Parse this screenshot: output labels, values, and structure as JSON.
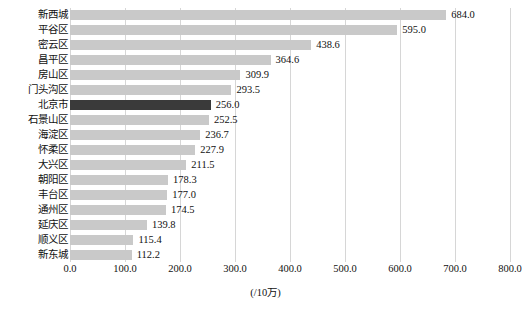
{
  "chart_data": {
    "type": "bar",
    "orientation": "horizontal",
    "title": "",
    "xlabel": "(/10万)",
    "ylabel": "",
    "xlim": [
      0,
      800
    ],
    "grid": true,
    "legend": null,
    "unit_label": "(/10万)",
    "categories": [
      "新西城",
      "平谷区",
      "密云区",
      "昌平区",
      "房山区",
      "门头沟区",
      "北京市",
      "石景山区",
      "海淀区",
      "怀柔区",
      "大兴区",
      "朝阳区",
      "丰台区",
      "通州区",
      "延庆区",
      "顺义区",
      "新东城"
    ],
    "values": [
      684.0,
      595.0,
      438.6,
      364.6,
      309.9,
      293.5,
      256.0,
      252.5,
      236.7,
      227.9,
      211.5,
      178.3,
      177.0,
      174.5,
      139.8,
      115.4,
      112.2
    ],
    "value_labels": [
      "684.0",
      "595.0",
      "438.6",
      "364.6",
      "309.9",
      "293.5",
      "256.0",
      "252.5",
      "236.7",
      "227.9",
      "211.5",
      "178.3",
      "177.0",
      "174.5",
      "139.8",
      "115.4",
      "112.2"
    ],
    "highlighted_category": "北京市",
    "highlight_index": 6,
    "xticks": [
      0,
      100,
      200,
      300,
      400,
      500,
      600,
      700,
      800
    ],
    "xtick_labels": [
      "0.0",
      "100.0",
      "200.0",
      "300.0",
      "400.0",
      "500.0",
      "600.0",
      "700.0",
      "800.0"
    ],
    "colors": {
      "bar": "#c9c9c9",
      "bar_highlight": "#3a3a3a",
      "gridline": "#d6d6d6",
      "text": "#111111",
      "background": "#ffffff"
    }
  },
  "caption": {
    "text": ""
  }
}
